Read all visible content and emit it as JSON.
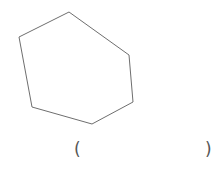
{
  "figure": {
    "shape": "hexagon",
    "stroke_color": "#6e6e6e",
    "vertices": [
      [
        69,
        12
      ],
      [
        129,
        55
      ],
      [
        133,
        102
      ],
      [
        92,
        124
      ],
      [
        32,
        107
      ],
      [
        19,
        37
      ]
    ]
  },
  "answer_blank": {
    "open": "(",
    "close": ")",
    "value": ""
  }
}
